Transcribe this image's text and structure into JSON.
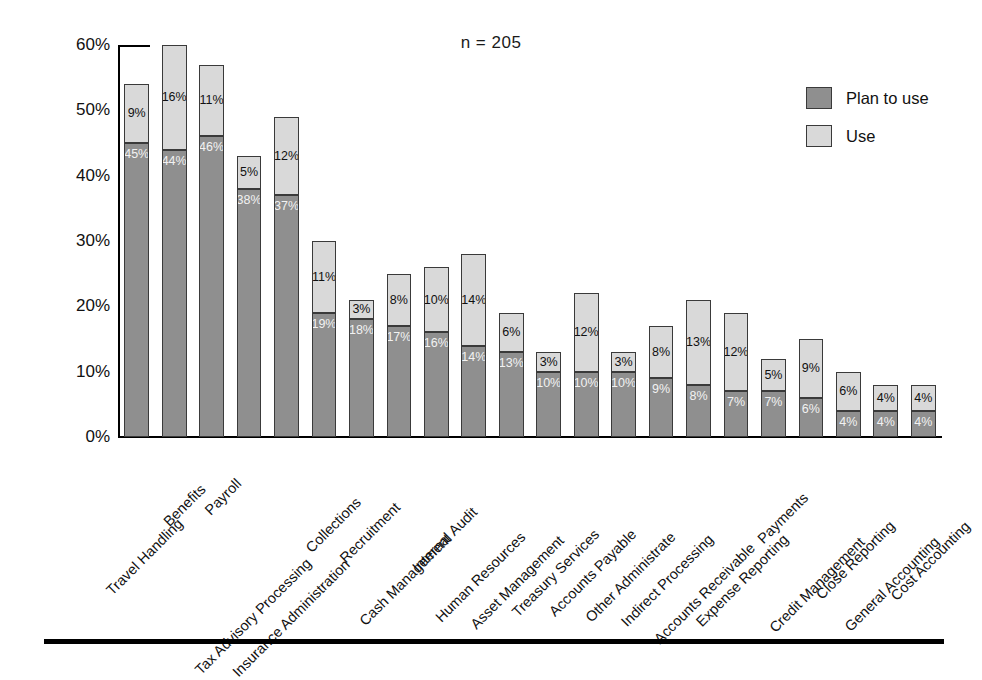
{
  "chart": {
    "title": "n = 205",
    "legend": {
      "position": "top-right",
      "items": [
        {
          "label": "Plan to use",
          "color": "#8f8f8f"
        },
        {
          "label": "Use",
          "color": "#d9d9d9"
        }
      ]
    }
  },
  "chart_data": {
    "type": "bar",
    "subtype": "stacked-vertical",
    "title": "n = 205",
    "xlabel": "",
    "ylabel": "",
    "ylim": [
      0,
      60
    ],
    "ytick_labels": [
      "0%",
      "10%",
      "20%",
      "30%",
      "40%",
      "50%",
      "60%"
    ],
    "ytick_values": [
      0,
      10,
      20,
      30,
      40,
      50,
      60
    ],
    "grid": false,
    "value_suffix": "%",
    "categories": [
      "Travel Handling",
      "Benefits",
      "Payroll",
      "Tax Advisory Processing",
      "Insurance Administration",
      "Collections",
      "Recruitment",
      "Cash Management",
      "Internal Audit",
      "Human Resources",
      "Asset Management",
      "Treasury Services",
      "Accounts Payable",
      "Other Administrate",
      "Indirect Processing",
      "Accounts Receivable",
      "Expense Reporting",
      "Payments",
      "Credit Management",
      "Close Reporting",
      "General Accounting",
      "Cost Accounting"
    ],
    "series": [
      {
        "name": "Plan to use",
        "color": "#8f8f8f",
        "values": [
          45,
          44,
          46,
          38,
          37,
          19,
          18,
          17,
          16,
          14,
          13,
          10,
          10,
          10,
          9,
          8,
          7,
          7,
          6,
          4,
          4,
          4
        ]
      },
      {
        "name": "Use",
        "color": "#d9d9d9",
        "values": [
          9,
          16,
          11,
          5,
          12,
          11,
          3,
          8,
          10,
          14,
          6,
          3,
          12,
          3,
          8,
          13,
          12,
          5,
          9,
          6,
          4,
          4
        ]
      }
    ],
    "totals": [
      54,
      60,
      57,
      43,
      49,
      30,
      21,
      25,
      26,
      28,
      19,
      13,
      22,
      13,
      17,
      21,
      19,
      12,
      15,
      10,
      8,
      8
    ],
    "labels": {
      "Plan to use": [
        "45%",
        "44%",
        "46%",
        "38%",
        "37%",
        "19%",
        "18%",
        "17%",
        "16%",
        "14%",
        "13%",
        "10%",
        "10%",
        "10%",
        "9%",
        "8%",
        "7%",
        "7%",
        "6%",
        "4%",
        "4%",
        "4%"
      ],
      "Use": [
        "9%",
        "16%",
        "11%",
        "5%",
        "12%",
        "11%",
        "3%",
        "8%",
        "10%",
        "14%",
        "6%",
        "3%",
        "12%",
        "3%",
        "8%",
        "13%",
        "12%",
        "5%",
        "9%",
        "6%",
        "4%",
        "4%"
      ]
    }
  }
}
